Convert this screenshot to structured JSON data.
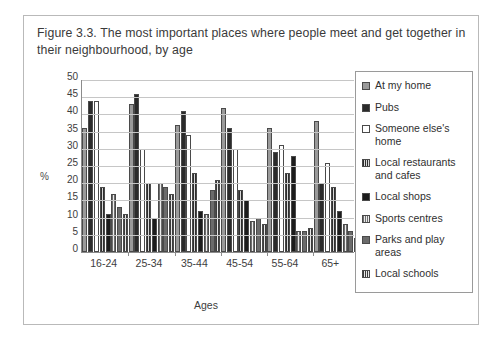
{
  "caption": "Figure 3.3. The most important places where people meet and get together in their neighbourhood, by age",
  "chart_data": {
    "type": "bar",
    "title": "Figure 3.3. The most important places where people meet and get together in their neighbourhood, by age",
    "xlabel": "Ages",
    "ylabel": "%",
    "ylim": [
      0,
      50
    ],
    "yticks": [
      50,
      45,
      40,
      35,
      30,
      25,
      20,
      15,
      10,
      5,
      0
    ],
    "grid": true,
    "legend_position": "right",
    "categories": [
      "16-24",
      "25-34",
      "35-44",
      "45-54",
      "55-64",
      "65+"
    ],
    "series": [
      {
        "name": "At my home",
        "values": [
          36,
          43,
          37,
          42,
          36,
          38
        ]
      },
      {
        "name": "Pubs",
        "values": [
          44,
          46,
          41,
          36,
          29,
          20
        ]
      },
      {
        "name": "Someone else's home",
        "values": [
          44,
          30,
          34,
          30,
          31,
          26
        ]
      },
      {
        "name": "Local restaurants and cafes",
        "values": [
          19,
          20,
          23,
          18,
          23,
          19
        ]
      },
      {
        "name": "Local shops",
        "values": [
          11,
          10,
          12,
          15,
          28,
          12
        ]
      },
      {
        "name": "Sports centres",
        "values": [
          17,
          20,
          11,
          9,
          6,
          8
        ]
      },
      {
        "name": "Parks and play areas",
        "values": [
          13,
          19,
          18,
          10,
          6,
          6
        ]
      },
      {
        "name": "Local schools",
        "values": [
          11,
          17,
          21,
          8,
          7,
          4
        ]
      }
    ]
  }
}
